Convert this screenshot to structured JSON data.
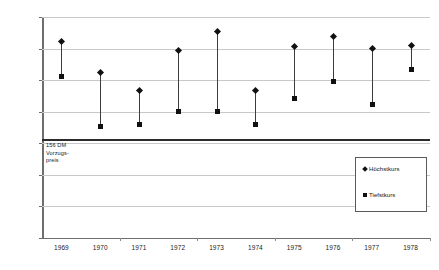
{
  "chart_data": {
    "type": "scatter",
    "title": "",
    "xlabel": "",
    "ylabel": "",
    "ylim": [
      0,
      350
    ],
    "ytick_step": 50,
    "yticks": [
      "0",
      "50",
      "100",
      "150",
      "200",
      "250",
      "300",
      "350"
    ],
    "grid": true,
    "legend_position": "inside-right",
    "categories": [
      "1969",
      "1970",
      "1971",
      "1972",
      "1973",
      "1974",
      "1975",
      "1976",
      "1977",
      "1978"
    ],
    "series": [
      {
        "name": "Höchstkurs",
        "marker": "diamond",
        "values": [
          311,
          262,
          233,
          297,
          327,
          233,
          303,
          319,
          300,
          305
        ]
      },
      {
        "name": "Tiefstkurs",
        "marker": "square",
        "values": [
          255,
          176,
          179,
          201,
          200,
          180,
          221,
          248,
          212,
          267
        ]
      }
    ],
    "annotations": [
      {
        "name": "vorzugspreis-reference",
        "value": 156,
        "label": "156 DM\nVorzugs-\npreis"
      }
    ]
  },
  "legend": {
    "items": [
      {
        "label": "Höchstkurs",
        "marker": "diamond"
      },
      {
        "label": "Tiefstkurs",
        "marker": "square"
      }
    ]
  }
}
